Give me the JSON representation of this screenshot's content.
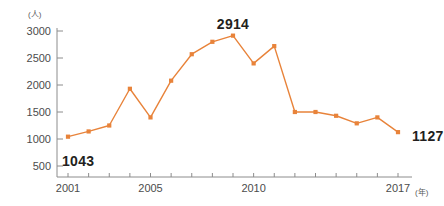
{
  "chart_data": {
    "type": "line",
    "title": "",
    "xlabel": "年",
    "ylabel": "人",
    "y_unit_label": "(人)",
    "x_unit_label": "(年)",
    "grid": false,
    "legend": "none",
    "line_color": "#E8833A",
    "marker_color": "#E8833A",
    "marker_shape": "square",
    "xlim": [
      2001,
      2017
    ],
    "ylim": [
      500,
      3000
    ],
    "ytick_values": [
      500,
      1000,
      1500,
      2000,
      2500,
      3000
    ],
    "ytick_labels": [
      "500",
      "1000",
      "1500",
      "2000",
      "2500",
      "3000"
    ],
    "xtick_values": [
      2001,
      2002,
      2003,
      2004,
      2005,
      2006,
      2007,
      2008,
      2009,
      2010,
      2011,
      2012,
      2013,
      2014,
      2015,
      2016,
      2017
    ],
    "xtick_labels_shown": [
      {
        "value": 2001,
        "label": "2001"
      },
      {
        "value": 2005,
        "label": "2005"
      },
      {
        "value": 2010,
        "label": "2010"
      },
      {
        "value": 2017,
        "label": "2017"
      }
    ],
    "x": [
      2001,
      2002,
      2003,
      2004,
      2005,
      2006,
      2007,
      2008,
      2009,
      2010,
      2011,
      2012,
      2013,
      2014,
      2015,
      2016,
      2017
    ],
    "values": [
      1043,
      1140,
      1250,
      1930,
      1400,
      2080,
      2570,
      2800,
      2914,
      2400,
      2720,
      1500,
      1500,
      1430,
      1290,
      1400,
      1127
    ],
    "annotations": [
      {
        "x": 2001,
        "y": 1043,
        "text": "1043"
      },
      {
        "x": 2009,
        "y": 2914,
        "text": "2914"
      },
      {
        "x": 2017,
        "y": 1127,
        "text": "1127"
      }
    ]
  }
}
